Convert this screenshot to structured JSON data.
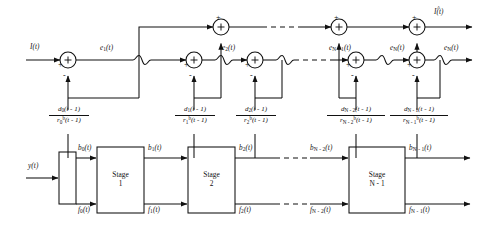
{
  "figure": {
    "type": "block-diagram",
    "background": "#ffffff",
    "line_color": "#111111"
  },
  "inputs": {
    "upper_input": "I(t)",
    "lower_input": "y(t)"
  },
  "outputs": {
    "estimate": "I(t)",
    "estimate_accent": "^",
    "residual": "e",
    "residual_sub": "N",
    "residual_full": "e_N(t)"
  },
  "error_nodes": [
    {
      "label": "e",
      "sub": "1",
      "arg": "(t)"
    },
    {
      "label": "e",
      "sub": "2",
      "arg": "(t)"
    },
    {
      "label": "e",
      "sub": "N - 1",
      "arg": "(t)"
    },
    {
      "label": "e",
      "sub": "N",
      "arg": "(t)"
    },
    {
      "label": "e",
      "sub": "N",
      "arg": "(t)"
    }
  ],
  "summers": {
    "plus": "+",
    "minus": "-",
    "glyph": "+"
  },
  "stages": [
    {
      "name": "Stage",
      "index": "1"
    },
    {
      "name": "Stage",
      "index": "2"
    },
    {
      "name": "Stage",
      "index": "N - 1"
    }
  ],
  "gains": [
    {
      "num_var": "d",
      "num_sub": "0",
      "num_arg": "(t - 1)",
      "den_var": "r",
      "den_sub": "0",
      "den_sup": "b",
      "den_arg": "(t - 1)"
    },
    {
      "num_var": "d",
      "num_sub": "1",
      "num_arg": "(t - 1)",
      "den_var": "r",
      "den_sub": "1",
      "den_sup": "b",
      "den_arg": "(t - 1)"
    },
    {
      "num_var": "d",
      "num_sub": "2",
      "num_arg": "(t - 1)",
      "den_var": "r",
      "den_sub": "2",
      "den_sup": "b",
      "den_arg": "(t - 1)"
    },
    {
      "num_var": "d",
      "num_sub": "N - 2",
      "num_arg": "(t - 1)",
      "den_var": "r",
      "den_sub": "N - 2",
      "den_sup": "b",
      "den_arg": "(t - 1)"
    },
    {
      "num_var": "d",
      "num_sub": "N - 1",
      "num_arg": "(t - 1)",
      "den_var": "r",
      "den_sub": "N - 1",
      "den_sup": "b",
      "den_arg": "(t - 1)"
    }
  ],
  "backward_signals": [
    {
      "var": "b",
      "sub": "0",
      "arg": "(t)"
    },
    {
      "var": "b",
      "sub": "1",
      "arg": "(t)"
    },
    {
      "var": "b",
      "sub": "2",
      "arg": "(t)"
    },
    {
      "var": "b",
      "sub": "N - 2",
      "arg": "(t)"
    },
    {
      "var": "b",
      "sub": "N - 1",
      "arg": "(t)"
    }
  ],
  "forward_signals": [
    {
      "var": "f",
      "sub": "0",
      "arg": "(t)"
    },
    {
      "var": "f",
      "sub": "1",
      "arg": "(t)"
    },
    {
      "var": "f",
      "sub": "2",
      "arg": "(t)"
    },
    {
      "var": "f",
      "sub": "N - 2",
      "arg": "(t)"
    },
    {
      "var": "f",
      "sub": "N - 1",
      "arg": "(t)"
    }
  ]
}
